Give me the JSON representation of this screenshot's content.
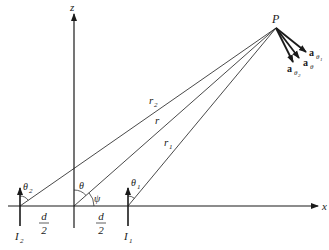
{
  "diagram": {
    "type": "two-element dipole array geometry",
    "labels": {
      "z_axis": "z",
      "x_axis": "x",
      "point": "P",
      "r2": "r",
      "r2_sub": "2",
      "r": "r",
      "r1": "r",
      "r1_sub": "1",
      "theta": "θ",
      "theta1": "θ",
      "theta1_sub": "1",
      "theta2": "θ",
      "theta2_sub": "2",
      "psi": "ψ",
      "I1": "I",
      "I1_sub": "1",
      "I2": "I",
      "I2_sub": "2",
      "d_left_num": "d",
      "d_left_den": "2",
      "d_right_num": "d",
      "d_right_den": "2",
      "a_theta1": "a",
      "a_theta1_sub": "θ",
      "a_theta1_subsub": "1",
      "a_theta": "a",
      "a_theta_sub": "θ",
      "a_theta2": "a",
      "a_theta2_sub": "θ",
      "a_theta2_subsub": "2"
    },
    "colors": {
      "ink": "#1a1a1a",
      "background": "#ffffff"
    }
  }
}
